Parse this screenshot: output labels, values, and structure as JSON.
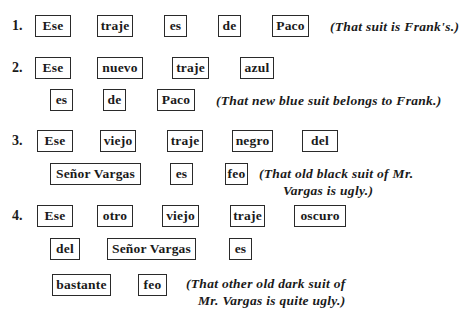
{
  "examples": [
    {
      "number": "1.",
      "lines": [
        [
          "Ese",
          "traje",
          "es",
          "de",
          "Paco"
        ]
      ],
      "translation": [
        "(That suit is Frank's.)"
      ]
    },
    {
      "number": "2.",
      "lines": [
        [
          "Ese",
          "nuevo",
          "traje",
          "azul"
        ],
        [
          "es",
          "de",
          "Paco"
        ]
      ],
      "translation": [
        "(That new blue suit belongs to Frank.)"
      ]
    },
    {
      "number": "3.",
      "lines": [
        [
          "Ese",
          "viejo",
          "traje",
          "negro",
          "del"
        ],
        [
          "Señor Vargas",
          "es",
          "feo"
        ]
      ],
      "translation": [
        "(That old black suit of Mr.",
        "Vargas is ugly.)"
      ]
    },
    {
      "number": "4.",
      "lines": [
        [
          "Ese",
          "otro",
          "viejo",
          "traje",
          "oscuro"
        ],
        [
          "del",
          "Señor Vargas",
          "es"
        ],
        [
          "bastante",
          "feo"
        ]
      ],
      "translation": [
        "(That other old dark suit of",
        "Mr. Vargas is quite ugly.)"
      ]
    }
  ]
}
